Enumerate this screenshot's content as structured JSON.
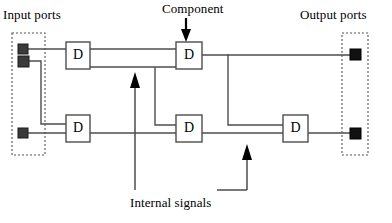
{
  "figure": {
    "type": "block-diagram",
    "background_color": "#ffffff",
    "line_color": "#4d4d4d",
    "dark_line_color": "#000000",
    "port_fill_color": "#3a3a3a",
    "output_port_fill_color": "#111111",
    "dashed_border_color": "#555555"
  },
  "labels": {
    "input_ports": "Input ports",
    "output_ports": "Output ports",
    "component": "Component",
    "internal_signals": "Internal signals"
  },
  "components": [
    {
      "id": "d-top-left",
      "label": "D",
      "x": 66,
      "y": 42,
      "w": 24,
      "h": 27
    },
    {
      "id": "d-top-middle",
      "label": "D",
      "x": 176,
      "y": 42,
      "w": 26,
      "h": 27
    },
    {
      "id": "d-bottom-left",
      "label": "D",
      "x": 66,
      "y": 115,
      "w": 24,
      "h": 27
    },
    {
      "id": "d-bottom-mid",
      "label": "D",
      "x": 176,
      "y": 115,
      "w": 26,
      "h": 27
    },
    {
      "id": "d-bottom-right",
      "label": "D",
      "x": 283,
      "y": 115,
      "w": 25,
      "h": 27
    }
  ],
  "input_port_group": {
    "box": {
      "x": 12,
      "y": 33,
      "w": 33,
      "h": 122
    },
    "ports": [
      {
        "id": "in-port-1",
        "x": 18,
        "y": 44,
        "size": 10
      },
      {
        "id": "in-port-2",
        "x": 18,
        "y": 56,
        "size": 11
      },
      {
        "id": "in-port-3",
        "x": 18,
        "y": 128,
        "size": 10
      }
    ]
  },
  "output_port_group": {
    "box": {
      "x": 342,
      "y": 33,
      "w": 26,
      "h": 122
    },
    "ports": [
      {
        "id": "out-port-1",
        "x": 350,
        "y": 45,
        "size": 11
      },
      {
        "id": "out-port-2",
        "x": 350,
        "y": 128,
        "size": 11
      }
    ]
  },
  "annotations": [
    {
      "id": "component-arrow",
      "direction": "down",
      "x": 186,
      "from_y": 18,
      "to_y": 41
    },
    {
      "id": "internal-signal-arrow-left",
      "direction": "up",
      "x": 135,
      "from_y": 190,
      "to_y": 73
    },
    {
      "id": "internal-signal-arrow-right",
      "direction": "up",
      "x": 247,
      "from_y": 190,
      "to_y": 145
    },
    {
      "id": "internal-signals-leader",
      "from_x": 218,
      "to_x": 247,
      "y": 190
    }
  ],
  "wires": [
    {
      "id": "wire-in1-to-dtl",
      "points": "28,49 66,49"
    },
    {
      "id": "wire-in2-down",
      "points": "28,61 41,61 41,124 66,124"
    },
    {
      "id": "wire-in3-to-dbl",
      "points": "28,133 66,133"
    },
    {
      "id": "wire-dtl-to-dtm-top",
      "points": "90,49 176,49"
    },
    {
      "id": "wire-dtl-to-dtm-bottom",
      "points": "90,67 176,67"
    },
    {
      "id": "wire-dtm-out-to-port1",
      "points": "202,55 350,55"
    },
    {
      "id": "wire-branch-down-right",
      "points": "228,55 228,125 283,125"
    },
    {
      "id": "wire-dbl-out",
      "points": "90,133 176,133"
    },
    {
      "id": "wire-dtm-down-to-dbm",
      "points": "155,68 155,125 176,125"
    },
    {
      "id": "wire-dbm-to-dbr",
      "points": "202,133 283,133"
    },
    {
      "id": "wire-dbr-to-port2",
      "points": "308,133 350,133"
    }
  ]
}
